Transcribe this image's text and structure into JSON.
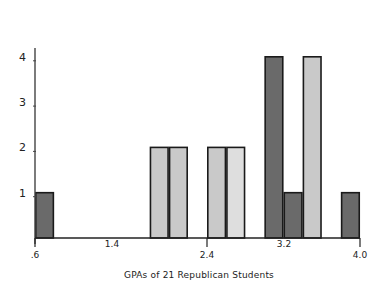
{
  "chart_data": {
    "type": "bar",
    "title": "",
    "xlabel": "GPAs of 21 Republican Students",
    "ylabel": "",
    "xlim": [
      0.6,
      4.0
    ],
    "ylim": [
      0,
      4.6
    ],
    "x_ticks": [
      ".6",
      "1.4",
      "2.4",
      "3.2",
      "4.0"
    ],
    "y_ticks": [
      "1",
      "2",
      "3",
      "4"
    ],
    "grid": false,
    "bin_width": 0.2,
    "bins": [
      {
        "x0": 0.6,
        "x1": 0.8,
        "count": 1,
        "shade": "dark"
      },
      {
        "x0": 1.8,
        "x1": 2.0,
        "count": 2,
        "shade": "light"
      },
      {
        "x0": 2.0,
        "x1": 2.2,
        "count": 2,
        "shade": "light"
      },
      {
        "x0": 2.4,
        "x1": 2.6,
        "count": 2,
        "shade": "light"
      },
      {
        "x0": 2.6,
        "x1": 2.8,
        "count": 2,
        "shade": "lighter"
      },
      {
        "x0": 3.0,
        "x1": 3.2,
        "count": 4,
        "shade": "dark"
      },
      {
        "x0": 3.2,
        "x1": 3.4,
        "count": 1,
        "shade": "dark"
      },
      {
        "x0": 3.4,
        "x1": 3.6,
        "count": 4,
        "shade": "light"
      },
      {
        "x0": 3.8,
        "x1": 4.0,
        "count": 1,
        "shade": "dark"
      }
    ],
    "categories": [
      "0.6-0.8",
      "1.8-2.0",
      "2.0-2.2",
      "2.4-2.6",
      "2.6-2.8",
      "3.0-3.2",
      "3.2-3.4",
      "3.4-3.6",
      "3.8-4.0"
    ],
    "values": [
      1,
      2,
      2,
      2,
      2,
      4,
      1,
      4,
      1
    ]
  },
  "colors": {
    "dark": "#6a6a6a",
    "light": "#c9c9c9",
    "lighter": "#dedede",
    "stroke": "#1a1a1a"
  }
}
